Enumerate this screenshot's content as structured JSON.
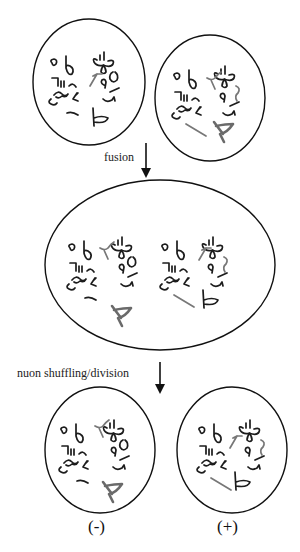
{
  "figure": {
    "colors": {
      "background": "#ffffff",
      "outline": "#111111",
      "dark_nuon": "#1c1c1c",
      "gray_nuon": "#777777"
    }
  },
  "stages": {
    "parents": {
      "cells": [
        {
          "id": "parent-cell-left",
          "description": "parental cell with dark nuon set"
        },
        {
          "id": "parent-cell-right",
          "description": "parental cell with partly gray nuon set"
        }
      ]
    },
    "fusion_step": {
      "label": "fusion"
    },
    "fused": {
      "cells": [
        {
          "id": "fused-cell",
          "description": "fused cell containing both nuon sets"
        }
      ]
    },
    "division_step": {
      "label": "nuon shuffling/division"
    },
    "daughters": {
      "cells": [
        {
          "id": "daughter-minus",
          "sign": "(-)"
        },
        {
          "id": "daughter-plus",
          "sign": "(+)"
        }
      ]
    }
  }
}
